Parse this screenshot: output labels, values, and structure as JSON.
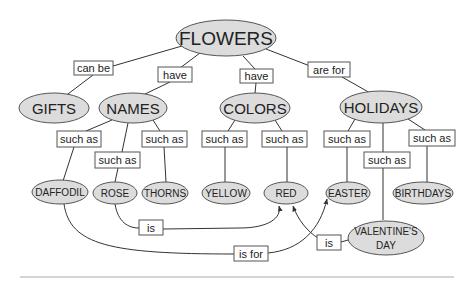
{
  "concepts": {
    "flowers": "FLOWERS",
    "gifts": "GIFTS",
    "names": "NAMES",
    "colors": "COLORS",
    "holidays": "HOLIDAYS",
    "daffodil": "DAFFODIL",
    "rose": "ROSE",
    "thorns": "THORNS",
    "yellow": "YELLOW",
    "red": "RED",
    "easter": "EASTER",
    "birthdays": "BIRTHDAYS",
    "valentines_line1": "VALENTINE'S",
    "valentines_line2": "DAY"
  },
  "links": {
    "can_be": "can be",
    "have_names": "have",
    "have_colors": "have",
    "are_for": "are for",
    "such_as_daffodil": "such as",
    "such_as_rose": "such as",
    "such_as_thorns": "such as",
    "such_as_yellow": "such as",
    "such_as_red": "such as",
    "such_as_easter": "such as",
    "such_as_valentines": "such as",
    "such_as_birthdays": "such as",
    "rose_is": "is",
    "daffodil_is_for": "is for",
    "valentines_is": "is"
  },
  "colors": {
    "node_fill": "#dcdcdc",
    "stroke": "#555555"
  }
}
